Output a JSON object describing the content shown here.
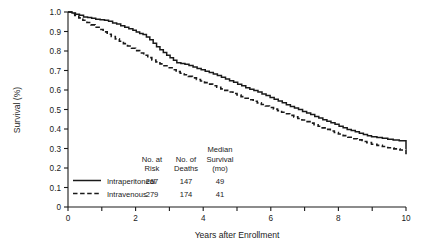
{
  "chart_data": {
    "type": "line",
    "title": "",
    "xlabel": "Years after Enrollment",
    "ylabel": "Survival (%)",
    "xlim": [
      0,
      10
    ],
    "ylim": [
      0,
      1.0
    ],
    "xticks": [
      0,
      1,
      2,
      3,
      4,
      5,
      6,
      7,
      8,
      9,
      10
    ],
    "xticklabels": [
      "0",
      "",
      "2",
      "",
      "4",
      "",
      "6",
      "",
      "8",
      "",
      "10"
    ],
    "yticks": [
      0,
      0.1,
      0.2,
      0.3,
      0.4,
      0.5,
      0.6,
      0.7,
      0.8,
      0.9,
      1.0
    ],
    "yticklabels": [
      "0",
      "0.1",
      "0.2",
      "0.3",
      "0.4",
      "0.5",
      "0.6",
      "0.7",
      "0.8",
      "0.9",
      "1.0"
    ],
    "grid": false,
    "legend_position": "lower-left",
    "series": [
      {
        "name": "Intraperitoneal",
        "linestyle": "solid",
        "color": "#1a1a1a",
        "points": [
          [
            0.0,
            1.0
          ],
          [
            0.12,
            0.995
          ],
          [
            0.22,
            0.988
          ],
          [
            0.34,
            0.983
          ],
          [
            0.46,
            0.975
          ],
          [
            0.58,
            0.972
          ],
          [
            0.7,
            0.968
          ],
          [
            0.82,
            0.963
          ],
          [
            0.95,
            0.96
          ],
          [
            1.08,
            0.958
          ],
          [
            1.2,
            0.952
          ],
          [
            1.32,
            0.944
          ],
          [
            1.44,
            0.938
          ],
          [
            1.56,
            0.93
          ],
          [
            1.68,
            0.922
          ],
          [
            1.8,
            0.914
          ],
          [
            1.92,
            0.906
          ],
          [
            2.02,
            0.898
          ],
          [
            2.12,
            0.89
          ],
          [
            2.22,
            0.884
          ],
          [
            2.32,
            0.872
          ],
          [
            2.42,
            0.858
          ],
          [
            2.52,
            0.84
          ],
          [
            2.62,
            0.822
          ],
          [
            2.72,
            0.806
          ],
          [
            2.82,
            0.792
          ],
          [
            2.92,
            0.778
          ],
          [
            3.02,
            0.766
          ],
          [
            3.12,
            0.752
          ],
          [
            3.22,
            0.74
          ],
          [
            3.34,
            0.736
          ],
          [
            3.46,
            0.732
          ],
          [
            3.58,
            0.726
          ],
          [
            3.7,
            0.718
          ],
          [
            3.82,
            0.71
          ],
          [
            3.94,
            0.704
          ],
          [
            4.06,
            0.696
          ],
          [
            4.18,
            0.69
          ],
          [
            4.3,
            0.682
          ],
          [
            4.42,
            0.674
          ],
          [
            4.54,
            0.666
          ],
          [
            4.66,
            0.656
          ],
          [
            4.78,
            0.648
          ],
          [
            4.9,
            0.64
          ],
          [
            5.02,
            0.63
          ],
          [
            5.14,
            0.622
          ],
          [
            5.26,
            0.612
          ],
          [
            5.38,
            0.604
          ],
          [
            5.5,
            0.598
          ],
          [
            5.62,
            0.59
          ],
          [
            5.74,
            0.58
          ],
          [
            5.86,
            0.572
          ],
          [
            5.98,
            0.562
          ],
          [
            6.1,
            0.552
          ],
          [
            6.22,
            0.544
          ],
          [
            6.34,
            0.534
          ],
          [
            6.46,
            0.524
          ],
          [
            6.58,
            0.516
          ],
          [
            6.7,
            0.508
          ],
          [
            6.82,
            0.5
          ],
          [
            6.94,
            0.49
          ],
          [
            7.06,
            0.482
          ],
          [
            7.18,
            0.474
          ],
          [
            7.3,
            0.464
          ],
          [
            7.42,
            0.456
          ],
          [
            7.54,
            0.448
          ],
          [
            7.66,
            0.44
          ],
          [
            7.78,
            0.432
          ],
          [
            7.9,
            0.424
          ],
          [
            8.02,
            0.414
          ],
          [
            8.14,
            0.406
          ],
          [
            8.26,
            0.398
          ],
          [
            8.38,
            0.392
          ],
          [
            8.5,
            0.386
          ],
          [
            8.62,
            0.378
          ],
          [
            8.74,
            0.372
          ],
          [
            8.86,
            0.366
          ],
          [
            8.98,
            0.36
          ],
          [
            9.14,
            0.356
          ],
          [
            9.3,
            0.352
          ],
          [
            9.46,
            0.348
          ],
          [
            9.62,
            0.344
          ],
          [
            9.8,
            0.34
          ],
          [
            10.0,
            0.336
          ],
          [
            10.2,
            0.33
          ],
          [
            10.45,
            0.326
          ],
          [
            10.7,
            0.322
          ],
          [
            11.0,
            0.318
          ],
          [
            11.3,
            0.314
          ],
          [
            11.7,
            0.31
          ],
          [
            12.2,
            0.306
          ],
          [
            12.8,
            0.302
          ],
          [
            13.6,
            0.3
          ],
          [
            14.6,
            0.298
          ],
          [
            15.8,
            0.296
          ]
        ]
      },
      {
        "name": "Intravenous",
        "linestyle": "dashed",
        "color": "#1a1a1a",
        "points": [
          [
            0.0,
            1.0
          ],
          [
            0.1,
            0.992
          ],
          [
            0.2,
            0.982
          ],
          [
            0.32,
            0.97
          ],
          [
            0.44,
            0.958
          ],
          [
            0.56,
            0.946
          ],
          [
            0.68,
            0.934
          ],
          [
            0.8,
            0.922
          ],
          [
            0.92,
            0.91
          ],
          [
            1.04,
            0.898
          ],
          [
            1.16,
            0.886
          ],
          [
            1.28,
            0.874
          ],
          [
            1.4,
            0.862
          ],
          [
            1.52,
            0.85
          ],
          [
            1.64,
            0.838
          ],
          [
            1.76,
            0.826
          ],
          [
            1.88,
            0.814
          ],
          [
            2.0,
            0.802
          ],
          [
            2.12,
            0.79
          ],
          [
            2.24,
            0.778
          ],
          [
            2.36,
            0.766
          ],
          [
            2.48,
            0.754
          ],
          [
            2.6,
            0.744
          ],
          [
            2.72,
            0.734
          ],
          [
            2.84,
            0.724
          ],
          [
            2.96,
            0.714
          ],
          [
            3.08,
            0.704
          ],
          [
            3.2,
            0.694
          ],
          [
            3.32,
            0.686
          ],
          [
            3.44,
            0.678
          ],
          [
            3.56,
            0.67
          ],
          [
            3.68,
            0.662
          ],
          [
            3.8,
            0.654
          ],
          [
            3.92,
            0.646
          ],
          [
            4.04,
            0.638
          ],
          [
            4.16,
            0.63
          ],
          [
            4.28,
            0.622
          ],
          [
            4.4,
            0.614
          ],
          [
            4.52,
            0.606
          ],
          [
            4.64,
            0.598
          ],
          [
            4.76,
            0.59
          ],
          [
            4.88,
            0.582
          ],
          [
            5.0,
            0.574
          ],
          [
            5.12,
            0.566
          ],
          [
            5.24,
            0.558
          ],
          [
            5.36,
            0.55
          ],
          [
            5.48,
            0.542
          ],
          [
            5.6,
            0.534
          ],
          [
            5.72,
            0.526
          ],
          [
            5.84,
            0.518
          ],
          [
            5.96,
            0.51
          ],
          [
            6.08,
            0.502
          ],
          [
            6.2,
            0.494
          ],
          [
            6.32,
            0.486
          ],
          [
            6.44,
            0.478
          ],
          [
            6.56,
            0.47
          ],
          [
            6.68,
            0.462
          ],
          [
            6.8,
            0.454
          ],
          [
            6.92,
            0.446
          ],
          [
            7.04,
            0.438
          ],
          [
            7.16,
            0.43
          ],
          [
            7.28,
            0.422
          ],
          [
            7.4,
            0.414
          ],
          [
            7.52,
            0.406
          ],
          [
            7.64,
            0.398
          ],
          [
            7.76,
            0.39
          ],
          [
            7.88,
            0.382
          ],
          [
            8.0,
            0.374
          ],
          [
            8.14,
            0.366
          ],
          [
            8.28,
            0.358
          ],
          [
            8.42,
            0.35
          ],
          [
            8.56,
            0.344
          ],
          [
            8.7,
            0.336
          ],
          [
            8.84,
            0.33
          ],
          [
            8.98,
            0.322
          ],
          [
            9.14,
            0.316
          ],
          [
            9.3,
            0.31
          ],
          [
            9.46,
            0.304
          ],
          [
            9.64,
            0.298
          ],
          [
            9.82,
            0.292
          ],
          [
            10.0,
            0.288
          ],
          [
            10.25,
            0.282
          ],
          [
            10.5,
            0.278
          ],
          [
            10.8,
            0.274
          ],
          [
            11.15,
            0.27
          ],
          [
            11.55,
            0.266
          ],
          [
            12.05,
            0.264
          ],
          [
            12.7,
            0.262
          ],
          [
            13.5,
            0.26
          ],
          [
            14.6,
            0.259
          ],
          [
            15.8,
            0.258
          ]
        ]
      }
    ],
    "legend_table": {
      "headers": [
        "No. at\nRisk",
        "No. of\nDeaths",
        "Median\nSurvival\n(mo)"
      ],
      "header_lines": {
        "median_label": "Median",
        "col1_line1": "No. at",
        "col1_line2": "Risk",
        "col2_line1": "No. of",
        "col2_line2": "Deaths",
        "col3_line2": "Survival",
        "col3_line3": "(mo)"
      },
      "rows": [
        {
          "label": "Intraperitoneal",
          "style": "solid",
          "at_risk": "267",
          "deaths": "147",
          "median_survival": "49"
        },
        {
          "label": "Intravenous",
          "style": "dashed",
          "at_risk": "279",
          "deaths": "174",
          "median_survival": "41"
        }
      ]
    }
  }
}
